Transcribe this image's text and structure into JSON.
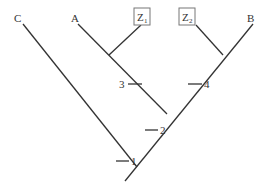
{
  "diagram": {
    "type": "cladogram",
    "taxa": [
      {
        "id": "C",
        "label": "C"
      },
      {
        "id": "A",
        "label": "A"
      },
      {
        "id": "Z1",
        "label": "Z",
        "subscript": "1",
        "boxed": true
      },
      {
        "id": "Z2",
        "label": "Z",
        "subscript": "2",
        "boxed": true
      },
      {
        "id": "B",
        "label": "B"
      }
    ],
    "ticks": [
      {
        "id": "1",
        "label": "1"
      },
      {
        "id": "2",
        "label": "2"
      },
      {
        "id": "3",
        "label": "3"
      },
      {
        "id": "4",
        "label": "4"
      }
    ],
    "colors": {
      "line": "#333333",
      "box": "#777777"
    }
  }
}
